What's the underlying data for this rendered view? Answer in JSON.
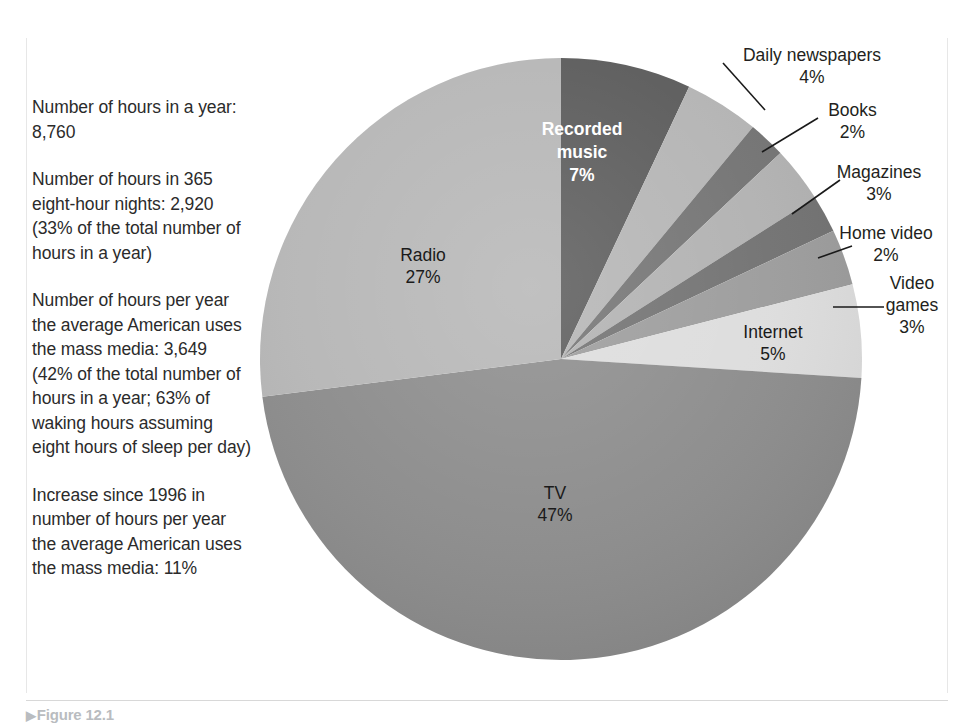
{
  "figure": {
    "caption_marker": "▶",
    "caption_text": "Figure 12.1"
  },
  "stats": {
    "items": [
      "Number of hours in a year: 8,760",
      "Number of hours in 365 eight-hour nights: 2,920 (33% of the total number of hours in a year)",
      "Number of hours per year the average American uses the mass media: 3,649 (42% of the total number of hours in a year; 63% of waking hours assuming eight hours of sleep per day)",
      "Increase since 1996 in number of hours per year the average American uses the mass media: 11%"
    ]
  },
  "chart_data": {
    "type": "pie",
    "title": "",
    "xlabel": "",
    "ylabel": "",
    "legend_position": "none",
    "grid": false,
    "units": "percent",
    "start_angle_deg": 0,
    "direction": "clockwise",
    "center": {
      "cx": 561,
      "cy": 359,
      "r": 301
    },
    "categories": [
      "Recorded music",
      "Daily newspapers",
      "Books",
      "Magazines",
      "Home video",
      "Video games",
      "Internet",
      "TV",
      "Radio"
    ],
    "values": [
      7,
      4,
      2,
      3,
      2,
      3,
      5,
      47,
      27
    ],
    "colors": [
      "#595959",
      "#b3b3b3",
      "#717171",
      "#b0b0b0",
      "#6f6f6f",
      "#9a9a9a",
      "#dcdcdc",
      "#8a8a8a",
      "#b5b5b5"
    ],
    "slices": [
      {
        "name": "Recorded music",
        "value": 7,
        "label": "Recorded music",
        "value_label": "7%",
        "color": "#595959",
        "label_placement": "inside-dark"
      },
      {
        "name": "Daily newspapers",
        "value": 4,
        "label": "Daily  newspapers",
        "value_label": "4%",
        "color": "#b3b3b3",
        "label_placement": "callout"
      },
      {
        "name": "Books",
        "value": 2,
        "label": "Books",
        "value_label": "2%",
        "color": "#717171",
        "label_placement": "callout"
      },
      {
        "name": "Magazines",
        "value": 3,
        "label": "Magazines",
        "value_label": "3%",
        "color": "#b0b0b0",
        "label_placement": "callout"
      },
      {
        "name": "Home video",
        "value": 2,
        "label": "Home video",
        "value_label": "2%",
        "color": "#6f6f6f",
        "label_placement": "callout"
      },
      {
        "name": "Video games",
        "value": 3,
        "label": "Video games",
        "value_label": "3%",
        "color": "#9a9a9a",
        "label_placement": "callout"
      },
      {
        "name": "Internet",
        "value": 5,
        "label": "Internet",
        "value_label": "5%",
        "color": "#dcdcdc",
        "label_placement": "inside"
      },
      {
        "name": "TV",
        "value": 47,
        "label": "TV",
        "value_label": "47%",
        "color": "#8a8a8a",
        "label_placement": "inside"
      },
      {
        "name": "Radio",
        "value": 27,
        "label": "Radio",
        "value_label": "27%",
        "color": "#b5b5b5",
        "label_placement": "inside"
      }
    ]
  },
  "callouts": {
    "daily_newspapers": {
      "name": "Daily  newspapers",
      "pct": "4%"
    },
    "books": {
      "name": "Books",
      "pct": "2%"
    },
    "magazines": {
      "name": "Magazines",
      "pct": "3%"
    },
    "home_video": {
      "name": "Home video",
      "pct": "2%"
    },
    "video_games_l1": {
      "name": "Video",
      "l2": "games",
      "pct": "3%"
    }
  },
  "inner": {
    "recorded_music_l1": "Recorded",
    "recorded_music_l2": "music",
    "recorded_music_pct": "7%",
    "radio": "Radio",
    "radio_pct": "27%",
    "tv": "TV",
    "tv_pct": "47%",
    "internet": "Internet",
    "internet_pct": "5%"
  }
}
